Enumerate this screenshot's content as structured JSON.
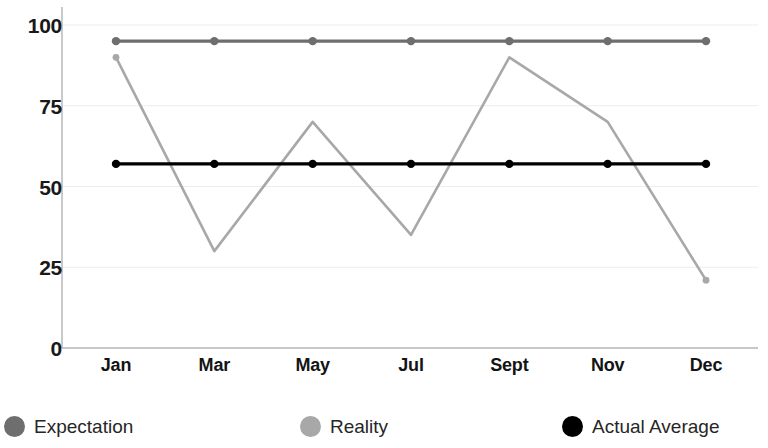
{
  "chart_data": {
    "type": "line",
    "title": "",
    "subtitle": "",
    "xlabel": "",
    "ylabel": "",
    "categories": [
      "Jan",
      "Mar",
      "May",
      "Jul",
      "Sept",
      "Nov",
      "Dec"
    ],
    "ylim": [
      0,
      100
    ],
    "yticks": [
      0,
      25,
      50,
      75,
      100
    ],
    "ytick_labels": [
      "0",
      "25",
      "50",
      "75",
      "100"
    ],
    "grid": true,
    "grid_axis": "y",
    "legend_position": "bottom",
    "series": [
      {
        "name": "Expectation",
        "color": "#6e6e6e",
        "values": [
          95,
          95,
          95,
          95,
          95,
          95,
          95
        ]
      },
      {
        "name": "Reality",
        "color": "#a8a8a8",
        "values": [
          90,
          30,
          70,
          35,
          90,
          70,
          21
        ]
      },
      {
        "name": "Actual Average",
        "color": "#000000",
        "values": [
          57,
          57,
          57,
          57,
          57,
          57,
          57
        ]
      }
    ]
  },
  "axes": {
    "y_tick_labels": [
      "100",
      "75",
      "50",
      "25",
      "0"
    ],
    "x_tick_labels": [
      "Jan",
      "Mar",
      "May",
      "Jul",
      "Sept",
      "Nov",
      "Dec"
    ]
  },
  "legend": {
    "items": [
      {
        "label": "Expectation",
        "color": "#6e6e6e",
        "marker": "circle-marker"
      },
      {
        "label": "Reality",
        "color": "#a8a8a8",
        "marker": "circle-marker"
      },
      {
        "label": "Actual Average",
        "color": "#000000",
        "marker": "circle-marker"
      }
    ]
  },
  "colors": {
    "expectation": "#6e6e6e",
    "reality": "#a8a8a8",
    "actual_average": "#000000",
    "grid": "#ededed",
    "axis": "#b4b4b4",
    "background": "#ffffff"
  }
}
